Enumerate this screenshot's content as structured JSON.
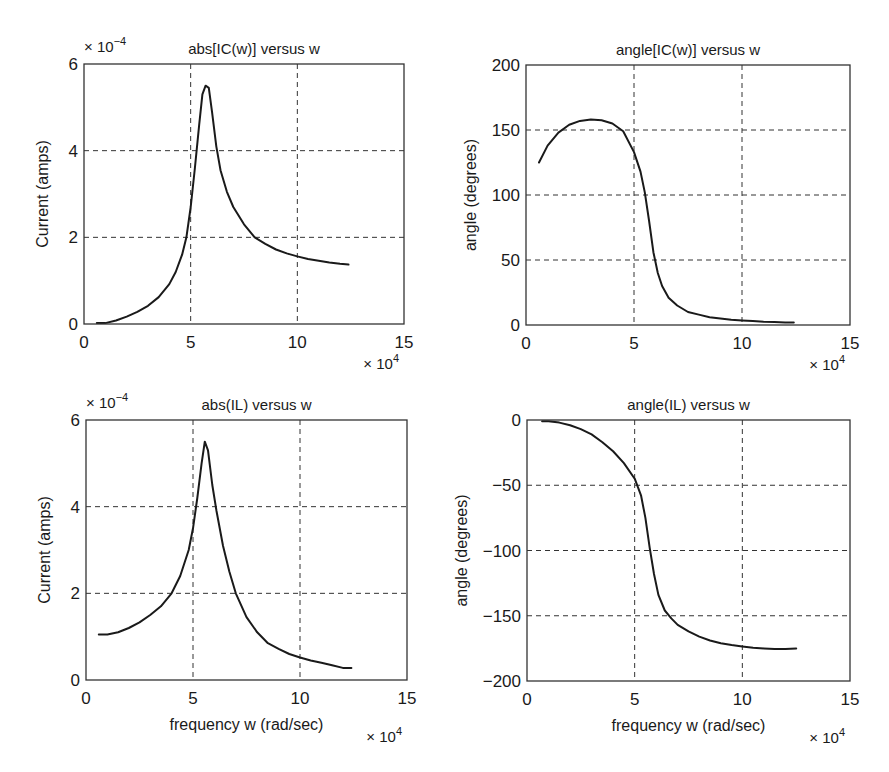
{
  "figure": {
    "width": 889,
    "height": 772,
    "layout": "2x2 subplots"
  },
  "chart_data": [
    {
      "type": "line",
      "id": "abs_ic",
      "title": "abs[IC(w)] versus w",
      "xlabel": "",
      "ylabel": "Current (amps)",
      "x_multiplier": "× 10^4",
      "y_multiplier": "× 10^-4",
      "xlim": [
        0,
        15
      ],
      "ylim": [
        0,
        6
      ],
      "xticks": [
        0,
        5,
        10,
        15
      ],
      "yticks": [
        0,
        2,
        4,
        6
      ],
      "xgrid": [
        5,
        10
      ],
      "ygrid": [
        2,
        4
      ],
      "grid": true,
      "box": {
        "left": 84,
        "top": 64,
        "right": 404,
        "bottom": 324
      },
      "series": [
        {
          "name": "abs[IC(w)]",
          "x": [
            0.6,
            1.0,
            1.5,
            2.0,
            2.5,
            3.0,
            3.5,
            4.0,
            4.3,
            4.6,
            4.8,
            5.0,
            5.2,
            5.4,
            5.55,
            5.7,
            5.85,
            6.0,
            6.2,
            6.4,
            6.7,
            7.0,
            7.5,
            8.0,
            8.5,
            9.0,
            9.5,
            10.0,
            10.5,
            11.0,
            11.5,
            12.0,
            12.4
          ],
          "values": [
            0.02,
            0.02,
            0.08,
            0.17,
            0.28,
            0.42,
            0.62,
            0.92,
            1.2,
            1.6,
            2.0,
            2.7,
            3.6,
            4.6,
            5.3,
            5.5,
            5.45,
            4.9,
            4.1,
            3.55,
            3.05,
            2.7,
            2.3,
            2.0,
            1.85,
            1.72,
            1.63,
            1.56,
            1.5,
            1.46,
            1.42,
            1.39,
            1.37
          ]
        }
      ]
    },
    {
      "type": "line",
      "id": "angle_ic",
      "title": "angle[IC(w)] versus w",
      "xlabel": "",
      "ylabel": "angle (degrees)",
      "x_multiplier": "× 10^4",
      "y_multiplier": "",
      "xlim": [
        0,
        15
      ],
      "ylim": [
        0,
        200
      ],
      "xticks": [
        0,
        5,
        10,
        15
      ],
      "yticks": [
        0,
        50,
        100,
        150,
        200
      ],
      "xgrid": [
        5,
        10
      ],
      "ygrid": [
        50,
        100,
        150
      ],
      "grid": true,
      "box": {
        "left": 526,
        "top": 65,
        "right": 850,
        "bottom": 325
      },
      "series": [
        {
          "name": "angle[IC(w)]",
          "x": [
            0.6,
            1.0,
            1.5,
            2.0,
            2.5,
            3.0,
            3.5,
            4.0,
            4.5,
            5.0,
            5.3,
            5.5,
            5.7,
            5.9,
            6.1,
            6.3,
            6.6,
            7.0,
            7.5,
            8.0,
            8.5,
            9.0,
            9.5,
            10.0,
            10.5,
            11.0,
            11.5,
            12.0,
            12.4
          ],
          "values": [
            125,
            138,
            148,
            154,
            157,
            158,
            157.5,
            155,
            149,
            133,
            118,
            102,
            80,
            56,
            40,
            30,
            21,
            15,
            10,
            8,
            6,
            5,
            4,
            3.5,
            3,
            2.5,
            2.2,
            2,
            2
          ]
        }
      ]
    },
    {
      "type": "line",
      "id": "abs_il",
      "title": "abs(IL) versus w",
      "xlabel": "frequency w (rad/sec)",
      "ylabel": "Current (amps)",
      "x_multiplier": "× 10^4",
      "y_multiplier": "× 10^-4",
      "xlim": [
        0,
        15
      ],
      "ylim": [
        0,
        6
      ],
      "xticks": [
        0,
        5,
        10,
        15
      ],
      "yticks": [
        0,
        2,
        4,
        6
      ],
      "xgrid": [
        5,
        10
      ],
      "ygrid": [
        2,
        4
      ],
      "grid": true,
      "box": {
        "left": 86,
        "top": 420,
        "right": 407,
        "bottom": 680
      },
      "series": [
        {
          "name": "abs(IL)",
          "x": [
            0.6,
            1.0,
            1.5,
            2.0,
            2.5,
            3.0,
            3.5,
            4.0,
            4.4,
            4.8,
            5.0,
            5.2,
            5.4,
            5.55,
            5.7,
            5.9,
            6.1,
            6.4,
            6.7,
            7.0,
            7.5,
            8.0,
            8.5,
            9.0,
            9.5,
            10.0,
            10.5,
            11.0,
            11.5,
            12.0,
            12.4
          ],
          "values": [
            1.05,
            1.05,
            1.1,
            1.2,
            1.33,
            1.5,
            1.7,
            2.0,
            2.4,
            3.0,
            3.5,
            4.2,
            5.0,
            5.5,
            5.3,
            4.5,
            3.9,
            3.1,
            2.5,
            2.0,
            1.45,
            1.1,
            0.85,
            0.72,
            0.6,
            0.52,
            0.45,
            0.4,
            0.34,
            0.28,
            0.28
          ]
        }
      ]
    },
    {
      "type": "line",
      "id": "angle_il",
      "title": "angle(IL) versus w",
      "xlabel": "frequency w (rad/sec)",
      "ylabel": "angle (degrees)",
      "x_multiplier": "× 10^4",
      "y_multiplier": "",
      "xlim": [
        0,
        15
      ],
      "ylim": [
        -200,
        0
      ],
      "xticks": [
        0,
        5,
        10,
        15
      ],
      "yticks": [
        -200,
        -150,
        -100,
        -50,
        0
      ],
      "xgrid": [
        5,
        10
      ],
      "ygrid": [
        -150,
        -100,
        -50
      ],
      "grid": true,
      "box": {
        "left": 527,
        "top": 420,
        "right": 850,
        "bottom": 681
      },
      "series": [
        {
          "name": "angle(IL)",
          "x": [
            0.7,
            1.0,
            1.5,
            2.0,
            2.5,
            3.0,
            3.5,
            4.0,
            4.5,
            5.0,
            5.3,
            5.5,
            5.7,
            5.9,
            6.1,
            6.4,
            6.7,
            7.0,
            7.5,
            8.0,
            8.5,
            9.0,
            9.5,
            10.0,
            10.5,
            11.0,
            11.5,
            12.0,
            12.5
          ],
          "values": [
            -1,
            -1,
            -2,
            -4,
            -7,
            -11,
            -17,
            -24,
            -33,
            -45,
            -58,
            -75,
            -98,
            -118,
            -134,
            -146,
            -152,
            -157,
            -162,
            -166,
            -169,
            -171,
            -172.5,
            -173.5,
            -174.5,
            -175,
            -175.5,
            -175.5,
            -175
          ]
        }
      ]
    }
  ],
  "labels": {
    "times": "×",
    "ten": "10",
    "exp_x": "4",
    "exp_y": "−4"
  }
}
